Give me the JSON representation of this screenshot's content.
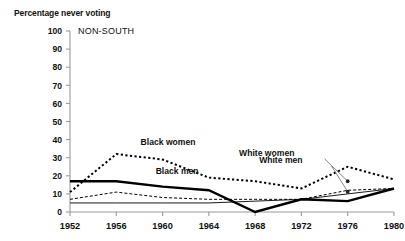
{
  "chart_data": {
    "type": "line",
    "title": "Percentage never voting",
    "panel_label": "NON-SOUTH",
    "xlabel": "",
    "ylabel": "Percentage never voting",
    "x": [
      1952,
      1956,
      1960,
      1964,
      1968,
      1972,
      1976,
      1980
    ],
    "categories": [
      "1952",
      "1956",
      "1960",
      "1964",
      "1968",
      "1972",
      "1976",
      "1980"
    ],
    "xlim": [
      1952,
      1980
    ],
    "ylim": [
      0,
      100
    ],
    "ytick_values": [
      0,
      10,
      20,
      30,
      40,
      50,
      60,
      70,
      80,
      90,
      100
    ],
    "ytick_labels": [
      "0",
      "10",
      "20",
      "30",
      "40",
      "50",
      "60",
      "70",
      "80",
      "90",
      "100"
    ],
    "grid": false,
    "legend": "inline-annotations",
    "series": [
      {
        "name": "Black men",
        "style": "thick-solid",
        "color": "#000000",
        "values": [
          17,
          17,
          14,
          12,
          0,
          7,
          6,
          13
        ]
      },
      {
        "name": "Black women",
        "style": "bold-dotted",
        "color": "#000000",
        "values": [
          11,
          32,
          29,
          19,
          17,
          13,
          25,
          18
        ]
      },
      {
        "name": "White women",
        "style": "thin-dashed",
        "color": "#000000",
        "values": [
          7,
          11,
          8,
          7,
          7,
          7,
          12,
          13
        ]
      },
      {
        "name": "White men",
        "style": "thin-solid",
        "color": "#000000",
        "values": [
          5,
          5,
          5,
          5,
          6,
          7,
          10,
          13
        ]
      }
    ],
    "annotations": [
      {
        "text": "Black women",
        "x": 1958.1,
        "y": 37
      },
      {
        "text": "Black men",
        "x": 1959.4,
        "y": 21
      },
      {
        "text": "White women",
        "x": 1971.4,
        "y": 31
      },
      {
        "text": "White men",
        "x": 1972.1,
        "y": 27
      }
    ]
  }
}
